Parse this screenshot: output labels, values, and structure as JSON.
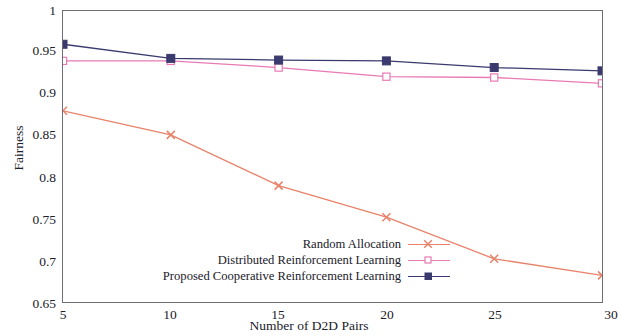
{
  "chart_data": {
    "type": "line",
    "title": "",
    "xlabel": "Number of D2D Pairs",
    "ylabel": "Fairness",
    "x": [
      5,
      10,
      15,
      20,
      25,
      30
    ],
    "xticks": [
      "5",
      "10",
      "15",
      "20",
      "25",
      "30"
    ],
    "yticks": [
      "0.65",
      "0.7",
      "0.75",
      "0.8",
      "0.85",
      "0.9",
      "0.95",
      "1"
    ],
    "xlim": [
      5,
      30
    ],
    "ylim": [
      0.65,
      1
    ],
    "grid": false,
    "legend_position": "bottom-center",
    "series": [
      {
        "name": "Random Allocation",
        "values": [
          0.88,
          0.851,
          0.79,
          0.752,
          0.702,
          0.682
        ],
        "color": "#e8826a",
        "marker": "x"
      },
      {
        "name": "Distributed Reinforcement Learning",
        "values": [
          0.94,
          0.94,
          0.932,
          0.921,
          0.92,
          0.913
        ],
        "color": "#e87ab4",
        "marker": "open-square"
      },
      {
        "name": "Proposed Cooperative Reinforcement Learning",
        "values": [
          0.96,
          0.943,
          0.941,
          0.94,
          0.932,
          0.928
        ],
        "color": "#3a3a6e",
        "marker": "filled-square"
      }
    ]
  },
  "axes": {
    "ylabel": "Fairness",
    "xlabel": "Number of D2D Pairs",
    "ytick_0": "0.65",
    "ytick_1": "0.7",
    "ytick_2": "0.75",
    "ytick_3": "0.8",
    "ytick_4": "0.85",
    "ytick_5": "0.9",
    "ytick_6": "0.95",
    "ytick_7": "1",
    "xtick_0": "5",
    "xtick_1": "10",
    "xtick_2": "15",
    "xtick_3": "20",
    "xtick_4": "25",
    "xtick_5": "30"
  },
  "legend": {
    "item_0": "Random Allocation",
    "item_1": "Distributed Reinforcement Learning",
    "item_2": "Proposed Cooperative Reinforcement Learning"
  }
}
